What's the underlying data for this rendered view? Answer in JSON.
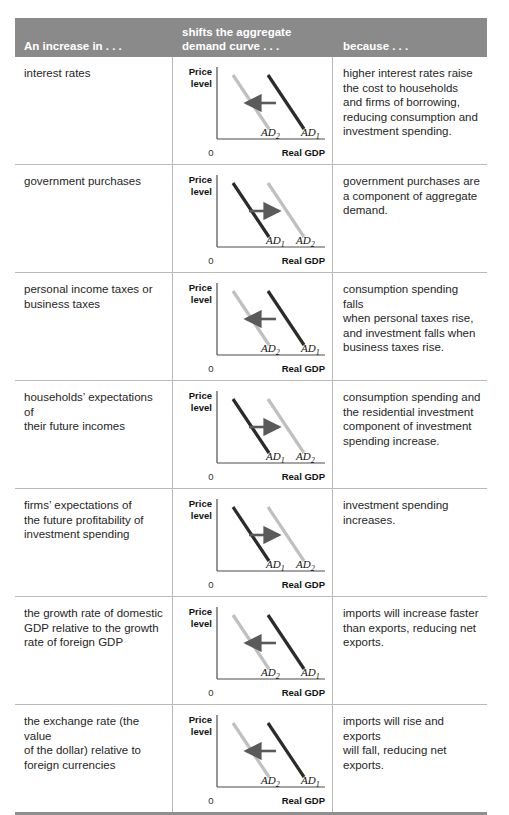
{
  "table": {
    "headers": {
      "col1": [
        "An increase in . . ."
      ],
      "col2": [
        "shifts the aggregate",
        "demand curve . . ."
      ],
      "col3": [
        "because . . ."
      ]
    },
    "colors": {
      "header_band": "#8a8a8a",
      "header_text": "#ffffff",
      "rule": "#b9b9b9",
      "bottom_rule": "#8f8f8f",
      "curve_dark": "#2b2b2b",
      "curve_light": "#c0c0c0",
      "arrow": "#5a5a5a"
    },
    "chart_labels": {
      "y_axis_line1": "Price",
      "y_axis_line2": "level",
      "x_axis": "Real GDP",
      "origin": "0",
      "ad1_text": "AD",
      "ad1_sub": "1",
      "ad2_text": "AD",
      "ad2_sub": "2"
    },
    "rows": [
      {
        "factor": [
          "interest rates"
        ],
        "shift": "left",
        "because": [
          "higher interest rates raise",
          "the cost to households",
          "and firms of borrowing,",
          "reducing consumption and",
          "investment spending."
        ]
      },
      {
        "factor": [
          "government purchases"
        ],
        "shift": "right",
        "because": [
          "government purchases are",
          "a component of aggregate",
          "demand."
        ]
      },
      {
        "factor": [
          "personal income taxes or",
          "business taxes"
        ],
        "shift": "left",
        "because": [
          "consumption spending falls",
          "when personal taxes rise,",
          "and investment falls when",
          "business taxes rise."
        ]
      },
      {
        "factor": [
          "households’ expectations of",
          "their future incomes"
        ],
        "shift": "right",
        "because": [
          "consumption spending and",
          "the residential investment",
          "component of investment",
          "spending increase."
        ]
      },
      {
        "factor": [
          "firms’ expectations of",
          "the future profitability of",
          "investment spending"
        ],
        "shift": "right",
        "because": [
          "investment spending",
          "increases."
        ]
      },
      {
        "factor": [
          "the growth rate of domestic",
          "GDP relative to the growth",
          "rate of foreign GDP"
        ],
        "shift": "left",
        "because": [
          "imports will increase faster",
          "than exports, reducing net",
          "exports."
        ]
      },
      {
        "factor": [
          "the exchange rate (the value",
          "of the dollar) relative to",
          "foreign currencies"
        ],
        "shift": "left",
        "because": [
          "imports will rise and exports",
          "will fall, reducing net",
          "exports."
        ]
      }
    ]
  },
  "chart_data": {
    "type": "line",
    "xlabel": "Real GDP",
    "ylabel": "Price level",
    "origin_label": "0",
    "grid": false,
    "legend": "inline-curve-labels",
    "panels": [
      {
        "row": 1,
        "shift_direction": "left",
        "series": [
          {
            "name": "AD1",
            "position": "right",
            "color": "#2b2b2b"
          },
          {
            "name": "AD2",
            "position": "left",
            "color": "#c0c0c0"
          }
        ]
      },
      {
        "row": 2,
        "shift_direction": "right",
        "series": [
          {
            "name": "AD1",
            "position": "left",
            "color": "#2b2b2b"
          },
          {
            "name": "AD2",
            "position": "right",
            "color": "#c0c0c0"
          }
        ]
      },
      {
        "row": 3,
        "shift_direction": "left",
        "series": [
          {
            "name": "AD1",
            "position": "right",
            "color": "#2b2b2b"
          },
          {
            "name": "AD2",
            "position": "left",
            "color": "#c0c0c0"
          }
        ]
      },
      {
        "row": 4,
        "shift_direction": "right",
        "series": [
          {
            "name": "AD1",
            "position": "left",
            "color": "#2b2b2b"
          },
          {
            "name": "AD2",
            "position": "right",
            "color": "#c0c0c0"
          }
        ]
      },
      {
        "row": 5,
        "shift_direction": "right",
        "series": [
          {
            "name": "AD1",
            "position": "left",
            "color": "#2b2b2b"
          },
          {
            "name": "AD2",
            "position": "right",
            "color": "#c0c0c0"
          }
        ]
      },
      {
        "row": 6,
        "shift_direction": "left",
        "series": [
          {
            "name": "AD1",
            "position": "right",
            "color": "#2b2b2b"
          },
          {
            "name": "AD2",
            "position": "left",
            "color": "#c0c0c0"
          }
        ]
      },
      {
        "row": 7,
        "shift_direction": "left",
        "series": [
          {
            "name": "AD1",
            "position": "right",
            "color": "#2b2b2b"
          },
          {
            "name": "AD2",
            "position": "left",
            "color": "#c0c0c0"
          }
        ]
      }
    ]
  }
}
